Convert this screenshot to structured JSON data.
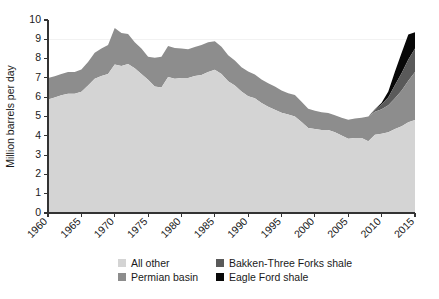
{
  "chart_data": {
    "type": "area",
    "stacked": true,
    "title": "",
    "subtitle": "",
    "xlabel": "",
    "ylabel": "Million barrels per day",
    "xlim": [
      1960,
      2015
    ],
    "ylim": [
      0,
      10
    ],
    "grid": "faint horizontal gridline at 9",
    "legend_position": "bottom-center",
    "ytick_labels": [
      "0",
      "1",
      "2",
      "3",
      "4",
      "5",
      "6",
      "7",
      "8",
      "9",
      "10"
    ],
    "ytick_values": [
      0,
      1,
      2,
      3,
      4,
      5,
      6,
      7,
      8,
      9,
      10
    ],
    "xtick_labels": [
      "1960",
      "1965",
      "1970",
      "1975",
      "1980",
      "1985",
      "1990",
      "1995",
      "2000",
      "2005",
      "2010",
      "2015"
    ],
    "xtick_values": [
      1960,
      1965,
      1970,
      1975,
      1980,
      1985,
      1990,
      1995,
      2000,
      2005,
      2010,
      2015
    ],
    "x": [
      1960,
      1961,
      1962,
      1963,
      1964,
      1965,
      1966,
      1967,
      1968,
      1969,
      1970,
      1971,
      1972,
      1973,
      1974,
      1975,
      1976,
      1977,
      1978,
      1979,
      1980,
      1981,
      1982,
      1983,
      1984,
      1985,
      1986,
      1987,
      1988,
      1989,
      1990,
      1991,
      1992,
      1993,
      1994,
      1995,
      1996,
      1997,
      1998,
      1999,
      2000,
      2001,
      2002,
      2003,
      2004,
      2005,
      2006,
      2007,
      2008,
      2009,
      2010,
      2011,
      2012,
      2013,
      2014,
      2015
    ],
    "series": [
      {
        "name": "All other",
        "color": "#d4d4d4",
        "values": [
          5.88,
          5.98,
          6.1,
          6.18,
          6.18,
          6.28,
          6.6,
          6.95,
          7.1,
          7.2,
          7.7,
          7.62,
          7.72,
          7.5,
          7.2,
          6.9,
          6.55,
          6.5,
          7.05,
          6.95,
          7.0,
          7.0,
          7.1,
          7.15,
          7.3,
          7.42,
          7.2,
          6.82,
          6.6,
          6.3,
          6.05,
          5.95,
          5.7,
          5.5,
          5.35,
          5.2,
          5.1,
          5.0,
          4.72,
          4.4,
          4.35,
          4.3,
          4.3,
          4.18,
          4.02,
          3.85,
          3.88,
          3.88,
          3.72,
          4.05,
          4.1,
          4.18,
          4.35,
          4.5,
          4.7,
          4.82
        ]
      },
      {
        "name": "Permian basin",
        "color": "#8d8d8d",
        "values": [
          1.12,
          1.1,
          1.1,
          1.12,
          1.12,
          1.15,
          1.22,
          1.35,
          1.42,
          1.5,
          1.88,
          1.7,
          1.55,
          1.35,
          1.32,
          1.2,
          1.5,
          1.6,
          1.6,
          1.6,
          1.52,
          1.48,
          1.5,
          1.55,
          1.55,
          1.48,
          1.42,
          1.35,
          1.3,
          1.25,
          1.28,
          1.22,
          1.22,
          1.22,
          1.2,
          1.15,
          1.1,
          1.12,
          1.05,
          1.0,
          0.95,
          0.92,
          0.88,
          0.88,
          0.92,
          0.98,
          1.02,
          1.05,
          1.28,
          1.2,
          1.28,
          1.4,
          1.6,
          1.85,
          2.15,
          2.48
        ]
      },
      {
        "name": "Bakken-Three Forks shale",
        "color": "#5a5a5a",
        "values": [
          0,
          0,
          0,
          0,
          0,
          0,
          0,
          0,
          0,
          0,
          0,
          0,
          0,
          0,
          0,
          0,
          0,
          0,
          0,
          0,
          0,
          0,
          0,
          0,
          0,
          0,
          0,
          0,
          0,
          0,
          0,
          0,
          0,
          0,
          0,
          0,
          0,
          0,
          0,
          0,
          0,
          0,
          0,
          0,
          0,
          0,
          0,
          0,
          0,
          0.1,
          0.25,
          0.42,
          0.68,
          0.9,
          1.1,
          1.22
        ]
      },
      {
        "name": "Eagle Ford shale",
        "color": "#080808",
        "values": [
          0,
          0,
          0,
          0,
          0,
          0,
          0,
          0,
          0,
          0,
          0,
          0,
          0,
          0,
          0,
          0,
          0,
          0,
          0,
          0,
          0,
          0,
          0,
          0,
          0,
          0,
          0,
          0,
          0,
          0,
          0,
          0,
          0,
          0,
          0,
          0,
          0,
          0,
          0,
          0,
          0,
          0,
          0,
          0,
          0,
          0,
          0,
          0,
          0,
          0.02,
          0.08,
          0.3,
          0.7,
          1.05,
          1.3,
          0.85
        ]
      }
    ],
    "totals": [
      7.0,
      7.08,
      7.2,
      7.3,
      7.3,
      7.43,
      7.82,
      8.3,
      8.52,
      8.7,
      9.58,
      9.32,
      9.27,
      8.85,
      8.52,
      8.1,
      8.05,
      8.1,
      8.65,
      8.55,
      8.52,
      8.48,
      8.6,
      8.7,
      8.85,
      8.9,
      8.62,
      8.17,
      7.9,
      7.55,
      7.33,
      7.17,
      6.92,
      6.72,
      6.55,
      6.35,
      6.2,
      6.12,
      5.77,
      5.4,
      5.3,
      5.22,
      5.18,
      5.06,
      4.94,
      4.83,
      4.9,
      4.93,
      5.0,
      5.37,
      5.71,
      6.3,
      7.33,
      8.3,
      9.25,
      9.37
    ]
  },
  "legend": {
    "items": [
      {
        "label": "All other",
        "color": "#d4d4d4"
      },
      {
        "label": "Bakken-Three Forks shale",
        "color": "#5a5a5a"
      },
      {
        "label": "Permian basin",
        "color": "#8d8d8d"
      },
      {
        "label": "Eagle Ford shale",
        "color": "#080808"
      }
    ]
  },
  "axes": {
    "y_title": "Million barrels per day"
  }
}
